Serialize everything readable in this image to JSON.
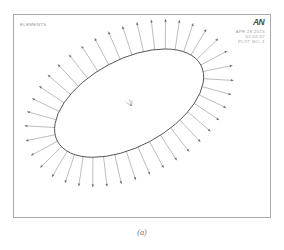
{
  "figure": {
    "caption": "(a)",
    "scan_artifact_text": "· ·· ··"
  },
  "plot": {
    "title_label": "ELEMENTS",
    "logo": "AN",
    "info": {
      "date": "APR 28 2015",
      "time": "02:02:57",
      "plot_no": "PLOT NO.   1"
    },
    "colors": {
      "frame": "#a9a9ad",
      "mesh_line": "#4a4a52",
      "arrow_line": "#6b6b73",
      "text": "#9a9aa0",
      "logo": "#4a4a52",
      "background": "#ffffff"
    }
  },
  "chart_data": {
    "type": "diagram",
    "title": "ELEMENTS",
    "geometry": {
      "shape": "ellipse",
      "center": [
        129,
        103
      ],
      "semi_major_axis": 82,
      "semi_minor_axis": 44,
      "rotation_deg": -28
    },
    "load_arrows": {
      "count": 40,
      "direction": "outward-normal",
      "length": 30,
      "tip_marker": "arrowhead"
    },
    "origin_triad": {
      "position": [
        129,
        103
      ],
      "label": "Y"
    }
  }
}
